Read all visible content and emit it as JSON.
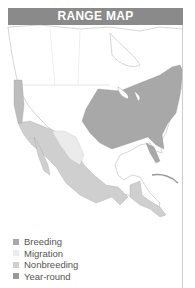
{
  "header": {
    "title": "RANGE MAP"
  },
  "legend": {
    "items": [
      {
        "label": "Breeding",
        "color": "#a8a8a8"
      },
      {
        "label": "Migration",
        "color": "#ebebeb"
      },
      {
        "label": "Nonbreeding",
        "color": "#cfcfcf"
      },
      {
        "label": "Year-round",
        "color": "#9a9a9a"
      }
    ]
  }
}
